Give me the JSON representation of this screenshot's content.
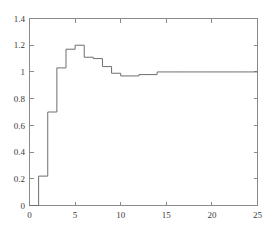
{
  "chart_data": {
    "type": "line",
    "title": "",
    "subtitle": "",
    "xlabel": "",
    "ylabel": "",
    "xlim": [
      0,
      25
    ],
    "ylim": [
      0,
      1.4
    ],
    "grid": false,
    "legend": null,
    "legend_position": "none",
    "line_style": "step-post",
    "line_color": "#6e6e6e",
    "axis_color": "#8a8a8a",
    "frame": "box",
    "xticks": [
      0,
      5,
      10,
      15,
      20,
      25
    ],
    "xtick_labels": [
      "0",
      "5",
      "10",
      "15",
      "20",
      "25"
    ],
    "yticks": [
      0,
      0.2,
      0.4,
      0.6,
      0.8,
      1,
      1.2,
      1.4
    ],
    "ytick_labels": [
      "0",
      "0.2",
      "0.4",
      "0.6",
      "0.8",
      "1",
      "1.2",
      "1.4"
    ],
    "x": [
      0,
      1,
      2,
      3,
      4,
      5,
      6,
      7,
      8,
      9,
      10,
      11,
      12,
      13,
      14,
      15,
      16,
      17,
      18,
      19,
      20,
      21,
      22,
      23,
      24,
      25
    ],
    "y": [
      0,
      0.22,
      0.7,
      1.03,
      1.17,
      1.2,
      1.11,
      1.1,
      1.04,
      0.99,
      0.97,
      0.97,
      0.98,
      0.98,
      1.0,
      1.0,
      1.0,
      1.0,
      1.0,
      1.0,
      1.0,
      1.0,
      1.0,
      1.0,
      1.0,
      1.0
    ],
    "values": [
      0,
      0.22,
      0.7,
      1.03,
      1.17,
      1.2,
      1.11,
      1.1,
      1.04,
      0.99,
      0.97,
      0.97,
      0.98,
      0.98,
      1.0,
      1.0,
      1.0,
      1.0,
      1.0,
      1.0,
      1.0,
      1.0,
      1.0,
      1.0,
      1.0,
      1.0
    ],
    "categories": [
      "0",
      "1",
      "2",
      "3",
      "4",
      "5",
      "6",
      "7",
      "8",
      "9",
      "10",
      "11",
      "12",
      "13",
      "14",
      "15",
      "16",
      "17",
      "18",
      "19",
      "20",
      "21",
      "22",
      "23",
      "24",
      "25"
    ],
    "series": [
      {
        "name": "step-response",
        "values": [
          0,
          0.22,
          0.7,
          1.03,
          1.17,
          1.2,
          1.11,
          1.1,
          1.04,
          0.99,
          0.97,
          0.97,
          0.98,
          0.98,
          1.0,
          1.0,
          1.0,
          1.0,
          1.0,
          1.0,
          1.0,
          1.0,
          1.0,
          1.0,
          1.0,
          1.0
        ]
      }
    ],
    "annotations": []
  },
  "axes": {
    "y_labels": [
      "1.4",
      "1.2",
      "1",
      "0.8",
      "0.6",
      "0.4",
      "0.2",
      "0"
    ],
    "x_labels": [
      "0",
      "5",
      "10",
      "15",
      "20",
      "25"
    ]
  }
}
